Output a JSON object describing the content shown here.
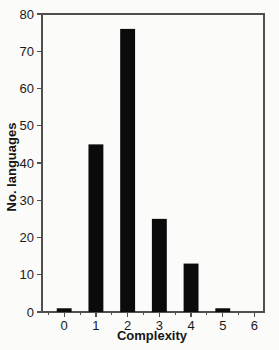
{
  "figure": {
    "background": "#fbfbfa",
    "text_color": "#1a1a1a",
    "axis_color": "#4f4f4f"
  },
  "chart_data": {
    "type": "bar",
    "categories": [
      0,
      1,
      2,
      3,
      4,
      5,
      6
    ],
    "values": [
      1,
      45,
      76,
      25,
      13,
      1,
      0
    ],
    "title": "",
    "xlabel": "Complexity",
    "ylabel": "No. languages",
    "xlim": [
      -0.7,
      6.3
    ],
    "ylim": [
      0,
      80
    ],
    "y_ticks": [
      0,
      10,
      20,
      30,
      40,
      50,
      60,
      70,
      80
    ],
    "x_ticks": [
      0,
      1,
      2,
      3,
      4,
      5,
      6
    ],
    "x_minor_ticks": [
      -0.5,
      0.5,
      1.5,
      2.5,
      3.5,
      4.5,
      5.5
    ],
    "bar_color": "#0b0b0b",
    "bar_width_units": 0.47,
    "grid": false,
    "legend": null,
    "frame": "full-box"
  }
}
